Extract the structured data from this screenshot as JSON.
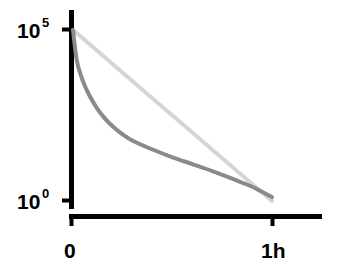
{
  "chart_data": {
    "type": "line",
    "title": "",
    "subtitle": "",
    "xlabel": "",
    "ylabel": "",
    "yscale": "log",
    "xscale": "linear",
    "grid": false,
    "legend": "none",
    "xlim": [
      0,
      1
    ],
    "ylim": [
      1,
      100000
    ],
    "x_tick_labels": [
      "0",
      "1h"
    ],
    "x_tick_values": [
      0,
      1
    ],
    "y_tick_labels": [
      "10^0",
      "10^5"
    ],
    "y_tick_values": [
      1,
      100000
    ],
    "y_tick_bases": [
      "10",
      "10"
    ],
    "y_tick_exponents": [
      "0",
      "5"
    ],
    "series": [
      {
        "name": "light-gray-line",
        "color": "#d5d5d5",
        "width": 4,
        "shape": "straight-exponential-decay",
        "x": [
          0.0,
          0.1,
          0.2,
          0.3,
          0.4,
          0.5,
          0.6,
          0.7,
          0.8,
          0.9,
          1.0
        ],
        "values": [
          100000,
          31623,
          10000,
          3162,
          1000,
          316,
          100,
          31.6,
          10,
          3.16,
          1
        ]
      },
      {
        "name": "dark-gray-curve",
        "color": "#8a8a8a",
        "width": 4,
        "shape": "biexponential-decay",
        "x": [
          0.0,
          0.02,
          0.05,
          0.08,
          0.12,
          0.16,
          0.2,
          0.25,
          0.3,
          0.4,
          0.5,
          0.6,
          0.7,
          0.8,
          0.9,
          1.0
        ],
        "values": [
          100000,
          12000,
          3200,
          1300,
          520,
          260,
          150,
          88,
          58,
          32,
          19,
          12,
          7.5,
          4.5,
          2.6,
          1.3
        ]
      }
    ],
    "axis_color": "#000000",
    "background_color": "#ffffff"
  }
}
